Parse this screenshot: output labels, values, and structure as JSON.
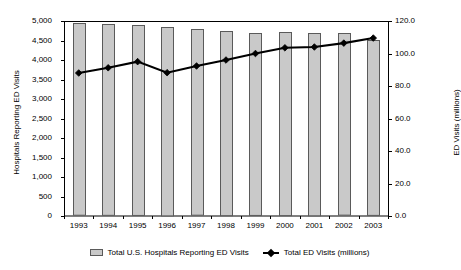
{
  "chart_data": {
    "type": "bar",
    "title": "",
    "subtitle": "",
    "xlabel": "",
    "ylabel": "Hospitals Reporting ED Visits",
    "ylabel_right": "ED Visits (millions)",
    "grid": false,
    "legend_position": "bottom",
    "categories": [
      "1993",
      "1994",
      "1995",
      "1996",
      "1997",
      "1998",
      "1999",
      "2000",
      "2001",
      "2002",
      "2003"
    ],
    "ylim": [
      0,
      5000
    ],
    "yticks": [
      "0",
      "500",
      "1,000",
      "1,500",
      "2,000",
      "2,500",
      "3,000",
      "3,500",
      "4,000",
      "4,500",
      "5,000"
    ],
    "ytick_values": [
      0,
      500,
      1000,
      1500,
      2000,
      2500,
      3000,
      3500,
      4000,
      4500,
      5000
    ],
    "ylim_right": [
      0,
      120
    ],
    "yticks_right": [
      "0.0",
      "20.0",
      "40.0",
      "60.0",
      "80.0",
      "100.0",
      "120.0"
    ],
    "ytick_values_right": [
      0,
      20,
      40,
      60,
      80,
      100,
      120
    ],
    "series": [
      {
        "name": "Total U.S. Hospitals Reporting ED Visits",
        "type": "bar",
        "axis": "left",
        "color": "#c9c9c9",
        "border_color": "#5a5a5a",
        "values": [
          4942,
          4919,
          4896,
          4856,
          4787,
          4748,
          4691,
          4721,
          4700,
          4683,
          4510
        ]
      },
      {
        "name": "Total ED Visits (millions)",
        "type": "line",
        "axis": "right",
        "color": "#000000",
        "values": [
          88.0,
          91.2,
          95.0,
          88.2,
          92.3,
          96.0,
          100.0,
          103.5,
          104.0,
          106.4,
          109.5
        ]
      }
    ]
  },
  "legend": {
    "bar_label": "Total U.S. Hospitals Reporting ED Visits",
    "line_label": "Total ED Visits (millions)"
  }
}
